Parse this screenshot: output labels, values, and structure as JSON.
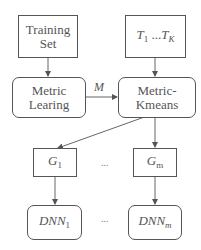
{
  "nodes": {
    "training_set": {
      "line1": "Training",
      "line2": "Set"
    },
    "t_range": {
      "t1": "T",
      "t1_sub": "1",
      "dots": " ...",
      "tk": "T",
      "tk_sub": "K"
    },
    "metric_learning": {
      "line1": "Metric",
      "line2": "Learing"
    },
    "metric_kmeans": {
      "line1": "Metric-",
      "line2": "Kmeans"
    },
    "g1": {
      "text": "G",
      "sub": "1"
    },
    "gm": {
      "text": "G",
      "sub": "m"
    },
    "dnn1": {
      "text": "DNN",
      "sub": "1"
    },
    "dnnm": {
      "text": "DNN",
      "sub": "m"
    }
  },
  "edges": {
    "m_label": "M",
    "ellipsis_g": "...",
    "ellipsis_dnn": "..."
  },
  "colors": {
    "stroke": "#555555",
    "background": "#ffffff"
  }
}
